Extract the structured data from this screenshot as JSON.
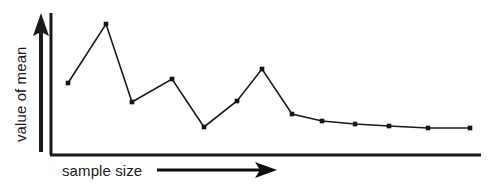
{
  "chart_data": {
    "type": "line",
    "title": "",
    "subtitle": "",
    "xlabel": "sample size",
    "ylabel": "value of mean",
    "xlim": [
      0,
      16
    ],
    "ylim": [
      0,
      10
    ],
    "grid": false,
    "legend": null,
    "axis_ticks": {
      "x": [],
      "y": []
    },
    "annotations": [
      {
        "name": "x-axis-direction-arrow",
        "text": "",
        "direction": "right"
      },
      {
        "name": "y-axis-direction-arrow",
        "text": "",
        "direction": "up"
      }
    ],
    "series": [
      {
        "name": "running mean",
        "color": "#1a1a1a",
        "marker": "square",
        "x": [
          1,
          2,
          3,
          4,
          5,
          6,
          7,
          8,
          9,
          10,
          11,
          12,
          13,
          14,
          15
        ],
        "values": [
          5.1,
          9.3,
          3.8,
          5.6,
          2.1,
          3.9,
          6.0,
          3.0,
          2.6,
          2.4,
          2.3,
          2.25,
          2.2,
          2.2,
          2.2
        ],
        "points_px": [
          [
            68,
            83
          ],
          [
            106,
            24
          ],
          [
            132,
            102
          ],
          [
            172,
            79
          ],
          [
            204,
            127
          ],
          [
            237,
            101
          ],
          [
            262,
            69
          ],
          [
            292,
            114
          ],
          [
            322,
            121
          ],
          [
            355,
            124
          ],
          [
            389,
            126
          ],
          [
            428,
            128
          ],
          [
            470,
            128
          ]
        ]
      }
    ]
  },
  "axes": {
    "x_label": "sample size",
    "y_label": "value of mean"
  },
  "colors": {
    "ink": "#1a1a1a",
    "line": "#3a3a3a",
    "background": "#ffffff"
  }
}
